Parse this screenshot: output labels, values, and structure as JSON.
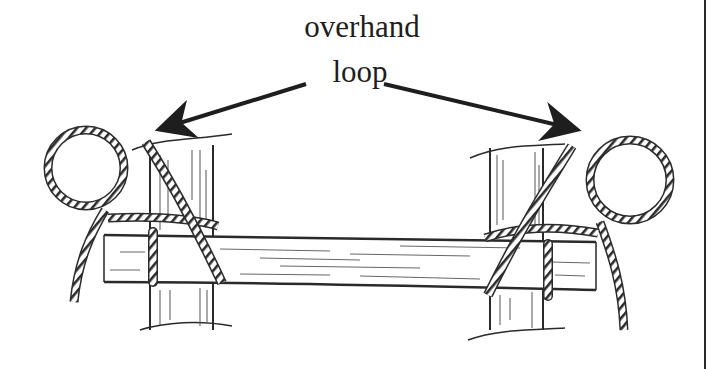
{
  "figure": {
    "label": {
      "line1": "overhand",
      "line2": "loop"
    },
    "arrows": [
      {
        "name": "left-arrow",
        "from": [
          306,
          84
        ],
        "to": [
          158,
          130
        ]
      },
      {
        "name": "right-arrow",
        "from": [
          384,
          84
        ],
        "to": [
          580,
          131
        ]
      }
    ],
    "elements": [
      {
        "name": "left-post"
      },
      {
        "name": "right-post"
      },
      {
        "name": "crossbar"
      },
      {
        "name": "left-overhand-loop"
      },
      {
        "name": "right-overhand-loop"
      }
    ],
    "colors": {
      "ink": "#1e1e1e",
      "background": "#ffffff",
      "border": "#2a2a2a"
    }
  }
}
